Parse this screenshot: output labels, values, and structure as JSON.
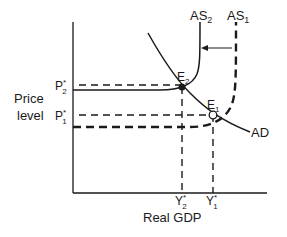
{
  "diagram": {
    "type": "aggregate-supply-demand",
    "y_axis_label_line1": "Price",
    "y_axis_label_line2": "level",
    "x_axis_label": "Real GDP",
    "curves": {
      "as2": {
        "label": "AS",
        "sub": "2"
      },
      "as1": {
        "label": "AS",
        "sub": "1"
      },
      "ad": {
        "label": "AD"
      }
    },
    "points": {
      "e2": {
        "label": "E",
        "sub": "2"
      },
      "e1": {
        "label": "E",
        "sub": "1"
      }
    },
    "price_ticks": {
      "p2": {
        "label": "P",
        "sub": "2",
        "sup": "*"
      },
      "p1": {
        "label": "P",
        "sub": "1",
        "sup": "*"
      }
    },
    "gdp_ticks": {
      "y2": {
        "label": "Y",
        "sub": "2",
        "sup": "*"
      },
      "y1": {
        "label": "Y",
        "sub": "1",
        "sup": "*"
      }
    },
    "shift_arrow": {
      "direction": "left",
      "from": "AS1",
      "to": "AS2"
    },
    "colors": {
      "ink": "#1a1a1a",
      "background": "#ffffff"
    }
  }
}
